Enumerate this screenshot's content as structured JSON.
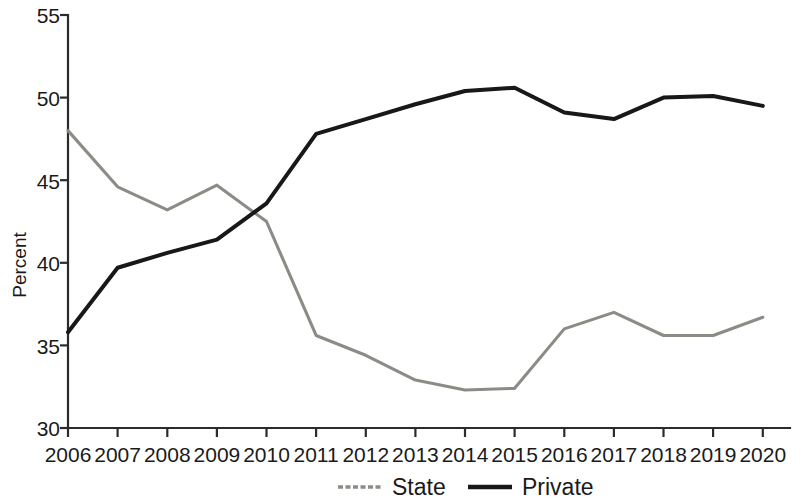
{
  "chart_data": {
    "type": "line",
    "title": "",
    "xlabel": "",
    "ylabel": "Percent",
    "x": [
      2006,
      2007,
      2008,
      2009,
      2010,
      2011,
      2012,
      2013,
      2014,
      2015,
      2016,
      2017,
      2018,
      2019,
      2020
    ],
    "categories": [
      "2006",
      "2007",
      "2008",
      "2009",
      "2010",
      "2011",
      "2012",
      "2013",
      "2014",
      "2015",
      "2016",
      "2017",
      "2018",
      "2019",
      "2020"
    ],
    "xlim": [
      2006,
      2020
    ],
    "ylim": [
      30,
      55
    ],
    "yticks": [
      30,
      35,
      40,
      45,
      50,
      55
    ],
    "ytick_labels": [
      "30",
      "35",
      "40",
      "45",
      "50",
      "55"
    ],
    "grid": false,
    "legend_position": "bottom-center",
    "series": [
      {
        "name": "State",
        "color": "#8c8c86",
        "style": "solid-gray",
        "values": [
          48.0,
          44.6,
          43.2,
          44.7,
          42.5,
          35.6,
          34.4,
          32.9,
          32.3,
          32.4,
          36.0,
          37.0,
          35.6,
          35.6,
          36.7
        ]
      },
      {
        "name": "Private",
        "color": "#181818",
        "style": "solid-black",
        "values": [
          35.8,
          39.7,
          40.6,
          41.4,
          43.6,
          47.8,
          48.7,
          49.6,
          50.4,
          50.6,
          49.1,
          48.7,
          50.0,
          50.1,
          49.5
        ]
      }
    ]
  },
  "axes": {
    "y_axis_title": "Percent"
  },
  "legend": {
    "entries": [
      {
        "label": "State"
      },
      {
        "label": "Private"
      }
    ]
  }
}
